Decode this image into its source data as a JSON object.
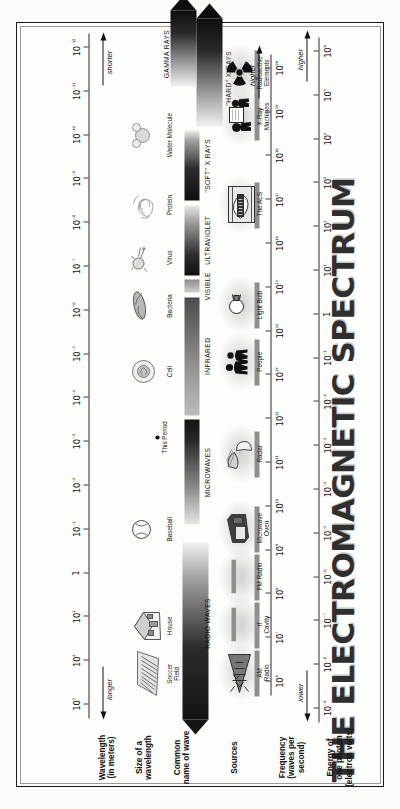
{
  "poster": {
    "title": "THE ELECTROMAGNETIC SPECTRUM",
    "bg_color": "#fdfdfc",
    "ink_color": "#1a1a1a"
  },
  "rows": {
    "wavelength_label": "Wavelength\n(in meters)",
    "size_label": "Size of a\nwavelength",
    "common_name_label": "Common\nname of wave",
    "sources_label": "Sources",
    "frequency_label": "Frequency\n(waves per\nsecond)",
    "energy_label": "Energy of\none photon\n(electron volts)"
  },
  "wavelength_axis": {
    "name": "Wavelength (in meters)",
    "ticks": [
      "10³",
      "10²",
      "10¹",
      "1",
      "10⁻¹",
      "10⁻²",
      "10⁻³",
      "10⁻⁴",
      "10⁻⁵",
      "10⁻⁶",
      "10⁻⁷",
      "10⁻⁸",
      "10⁻⁹",
      "10⁻¹⁰",
      "10⁻¹¹",
      "10⁻¹²"
    ],
    "tick_exponents": [
      3,
      2,
      1,
      0,
      -1,
      -2,
      -3,
      -4,
      -5,
      -6,
      -7,
      -8,
      -9,
      -10,
      -11,
      -12
    ],
    "direction_low": "longer",
    "direction_high": "shorter"
  },
  "frequency_axis": {
    "name": "Frequency (waves per second)",
    "ticks": [
      "10⁶",
      "10⁷",
      "10⁸",
      "10⁹",
      "10¹⁰",
      "10¹¹",
      "10¹²",
      "10¹³",
      "10¹⁴",
      "10¹⁵",
      "10¹⁶",
      "10¹⁷",
      "10¹⁸",
      "10¹⁹",
      "10²⁰"
    ],
    "tick_exponents": [
      6,
      7,
      8,
      9,
      10,
      11,
      12,
      13,
      14,
      15,
      16,
      17,
      18,
      19,
      20
    ],
    "direction_high": "higher"
  },
  "energy_axis": {
    "name": "Energy of one photon (electron volts)",
    "ticks": [
      "10⁻⁹",
      "10⁻⁸",
      "10⁻⁷",
      "10⁻⁶",
      "10⁻⁵",
      "10⁻⁴",
      "10⁻³",
      "10⁻²",
      "10⁻¹",
      "1",
      "10¹",
      "10²",
      "10³",
      "10⁴",
      "10⁵",
      "10⁶"
    ],
    "tick_exponents": [
      -9,
      -8,
      -7,
      -6,
      -5,
      -4,
      -3,
      -2,
      -1,
      0,
      1,
      2,
      3,
      4,
      5,
      6
    ],
    "direction_low": "lower",
    "direction_high": "higher"
  },
  "size_objects": [
    {
      "label": "Soccer\nField",
      "icon": "soccer-field-icon",
      "wavelength_exp": 2.3
    },
    {
      "label": "House",
      "icon": "house-icon",
      "wavelength_exp": 1.2
    },
    {
      "label": "Baseball",
      "icon": "baseball-icon",
      "wavelength_exp": -1.0
    },
    {
      "label": "This Period",
      "icon": "period-dot-icon",
      "wavelength_exp": -3.1
    },
    {
      "label": "Cell",
      "icon": "cell-icon",
      "wavelength_exp": -4.6
    },
    {
      "label": "Bacteria",
      "icon": "bacteria-icon",
      "wavelength_exp": -6.1
    },
    {
      "label": "Virus",
      "icon": "virus-icon",
      "wavelength_exp": -7.2
    },
    {
      "label": "Protein",
      "icon": "protein-icon",
      "wavelength_exp": -8.4
    },
    {
      "label": "Water Molecule",
      "icon": "water-molecule-icon",
      "wavelength_exp": -10.0
    }
  ],
  "bands": [
    {
      "name": "RADIO WAVES",
      "from_exp": 3.0,
      "to_exp": -0.7
    },
    {
      "name": "MICROWAVES",
      "from_exp": -1.1,
      "to_exp": -3.5
    },
    {
      "name": "INFRARED",
      "from_exp": -3.6,
      "to_exp": -6.3
    },
    {
      "name": "VISIBLE",
      "from_exp": -6.4,
      "to_exp": -6.7
    },
    {
      "name": "ULTRAVIOLET",
      "from_exp": -6.8,
      "to_exp": -8.4
    },
    {
      "name": "\"SOFT\" X RAYS",
      "from_exp": -8.5,
      "to_exp": -10.1
    },
    {
      "name": "\"HARD\" X RAYS",
      "from_exp": -10.2,
      "to_exp": -12.4
    },
    {
      "name": "GAMMA RAYS",
      "from_exp": -11.1,
      "to_exp": -12.6
    }
  ],
  "sources": [
    {
      "label": "AM\nRadio",
      "icon": "am-radio-tower-icon",
      "freq_exp": 6.2
    },
    {
      "label": "rf\nCavity",
      "icon": "rf-cavity-icon",
      "freq_exp": 7.3
    },
    {
      "label": "FM Radio",
      "icon": "fm-radio-bar-icon",
      "freq_exp": 8.4
    },
    {
      "label": "Microwave\nOven",
      "icon": "microwave-oven-icon",
      "freq_exp": 9.5
    },
    {
      "label": "Radar",
      "icon": "radar-dish-icon",
      "freq_exp": 11.2
    },
    {
      "label": "People",
      "icon": "people-icon",
      "freq_exp": 13.3
    },
    {
      "label": "Light Bulb",
      "icon": "light-bulb-icon",
      "freq_exp": 14.6
    },
    {
      "label": "The ALS",
      "icon": "als-synchrotron-icon",
      "freq_exp": 16.9
    },
    {
      "label": "X-Ray\nMachines",
      "icon": "xray-machine-icon",
      "freq_exp": 18.9
    },
    {
      "label": "Radioactive\nElements",
      "icon": "radioactive-trefoil-icon",
      "freq_exp": 19.9
    }
  ]
}
